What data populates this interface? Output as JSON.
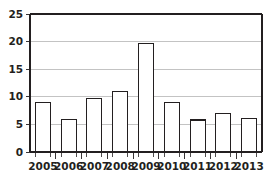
{
  "chart_data": {
    "type": "bar",
    "title": "",
    "subtitle": "",
    "xlabel": "",
    "ylabel": "",
    "categories": [
      "2005",
      "2006",
      "2007",
      "2008",
      "2009",
      "2010",
      "2011",
      "2012",
      "2013"
    ],
    "values": [
      9,
      5.9,
      9.7,
      11,
      19.7,
      8.9,
      5.8,
      6.9,
      6
    ],
    "ylim": [
      0,
      25
    ],
    "yticks": [
      0,
      5,
      10,
      15,
      20,
      25
    ],
    "ytick_labels": [
      "0",
      "5",
      "10",
      "15",
      "20",
      "25"
    ],
    "xtick_labels": [
      "2005",
      "2006",
      "2007",
      "2008",
      "2009",
      "2010",
      "2011",
      "2012",
      "2013"
    ],
    "grid": true,
    "grid_axis": "y",
    "legend": false,
    "legend_position": "none",
    "annotations": [],
    "bar_fill_color": "#ffffff",
    "bar_edge_color": "#231f20",
    "grid_color": "#a9a9aa",
    "axis_color": "#231f20",
    "background_color": "#ffffff"
  },
  "plot": {
    "left": 30,
    "right": 262,
    "top": 14,
    "bottom": 152,
    "bar_width_px": 15,
    "category_width_px": 25.8
  }
}
